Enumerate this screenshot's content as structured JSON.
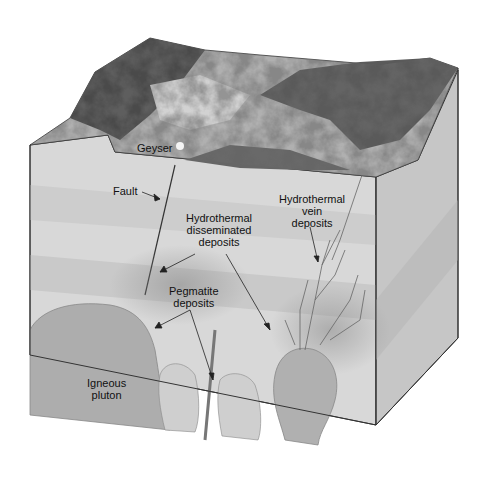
{
  "diagram": {
    "labels": {
      "geyser": "Geyser",
      "fault": "Fault",
      "disseminated": [
        "Hydrothermal",
        "disseminated",
        "deposits"
      ],
      "vein": [
        "Hydrothermal",
        "vein",
        "deposits"
      ],
      "pegmatite": [
        "Pegmatite",
        "deposits"
      ],
      "pluton": [
        "Igneous",
        "pluton"
      ]
    },
    "colors": {
      "background": "#ffffff",
      "front_face": "#d6d6d6",
      "side_face": "#c4c4c4",
      "top_surface": "#9a9a9a",
      "mountains": "#3a3a3a",
      "pluton": "#a9a9a9",
      "stroke": "#333333"
    }
  }
}
